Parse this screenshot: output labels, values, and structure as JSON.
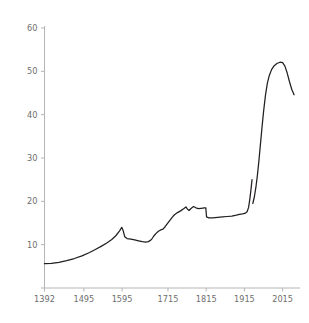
{
  "chart_data": {
    "type": "line",
    "title": "",
    "subtitle": "",
    "xlabel": "",
    "ylabel": "",
    "xlim": [
      1392,
      2050
    ],
    "ylim": [
      0,
      60
    ],
    "grid": false,
    "legend": null,
    "y_ticks": [
      0,
      10,
      20,
      30,
      40,
      50,
      60
    ],
    "y_tick_labels": [
      "",
      "10",
      "20",
      "30",
      "40",
      "50",
      "60"
    ],
    "x_ticks": [
      1392,
      1495,
      1595,
      1715,
      1815,
      1915,
      2015
    ],
    "x_tick_labels": [
      "1392",
      "1495",
      "1595",
      "1715",
      "1815",
      "1915",
      "2015"
    ],
    "series": [
      {
        "name": "main",
        "segment": 1,
        "points": [
          [
            1392,
            5.6
          ],
          [
            1410,
            5.7
          ],
          [
            1430,
            5.9
          ],
          [
            1450,
            6.3
          ],
          [
            1470,
            6.8
          ],
          [
            1490,
            7.4
          ],
          [
            1510,
            8.2
          ],
          [
            1525,
            8.9
          ],
          [
            1540,
            9.6
          ],
          [
            1555,
            10.4
          ],
          [
            1568,
            11.2
          ],
          [
            1578,
            12.0
          ],
          [
            1588,
            13.1
          ],
          [
            1594,
            14.0
          ],
          [
            1598,
            13.2
          ],
          [
            1602,
            11.8
          ],
          [
            1608,
            11.4
          ],
          [
            1618,
            11.3
          ],
          [
            1628,
            11.1
          ],
          [
            1638,
            10.9
          ],
          [
            1648,
            10.7
          ],
          [
            1656,
            10.6
          ],
          [
            1664,
            10.7
          ],
          [
            1672,
            11.2
          ],
          [
            1678,
            12.0
          ],
          [
            1684,
            12.6
          ],
          [
            1690,
            13.1
          ],
          [
            1696,
            13.4
          ],
          [
            1702,
            13.6
          ],
          [
            1708,
            14.2
          ],
          [
            1714,
            14.9
          ],
          [
            1720,
            15.6
          ],
          [
            1726,
            16.3
          ],
          [
            1732,
            16.9
          ],
          [
            1740,
            17.4
          ],
          [
            1748,
            17.8
          ],
          [
            1756,
            18.3
          ],
          [
            1762,
            18.7
          ],
          [
            1766,
            18.2
          ],
          [
            1770,
            17.9
          ],
          [
            1776,
            18.4
          ],
          [
            1782,
            18.8
          ],
          [
            1788,
            18.5
          ],
          [
            1795,
            18.3
          ],
          [
            1802,
            18.4
          ],
          [
            1810,
            18.5
          ],
          [
            1814,
            18.5
          ],
          [
            1816,
            16.4
          ],
          [
            1822,
            16.2
          ],
          [
            1832,
            16.2
          ],
          [
            1845,
            16.3
          ],
          [
            1858,
            16.4
          ],
          [
            1870,
            16.5
          ],
          [
            1882,
            16.6
          ],
          [
            1894,
            16.8
          ],
          [
            1902,
            17.0
          ],
          [
            1910,
            17.1
          ],
          [
            1916,
            17.2
          ],
          [
            1922,
            17.6
          ],
          [
            1926,
            18.6
          ],
          [
            1929,
            20.4
          ],
          [
            1932,
            22.6
          ],
          [
            1935,
            25.0
          ]
        ]
      },
      {
        "name": "main",
        "segment": 2,
        "points": [
          [
            1937,
            19.5
          ],
          [
            1941,
            21.0
          ],
          [
            1945,
            23.2
          ],
          [
            1949,
            26.0
          ],
          [
            1953,
            29.4
          ],
          [
            1957,
            33.2
          ],
          [
            1961,
            37.0
          ],
          [
            1965,
            40.6
          ],
          [
            1970,
            44.4
          ],
          [
            1975,
            47.2
          ],
          [
            1980,
            49.0
          ],
          [
            1986,
            50.4
          ],
          [
            1993,
            51.3
          ],
          [
            2000,
            51.8
          ],
          [
            2008,
            52.1
          ],
          [
            2015,
            52.0
          ],
          [
            2021,
            51.2
          ],
          [
            2027,
            49.6
          ],
          [
            2033,
            47.6
          ],
          [
            2039,
            45.8
          ],
          [
            2045,
            44.6
          ]
        ]
      }
    ]
  }
}
